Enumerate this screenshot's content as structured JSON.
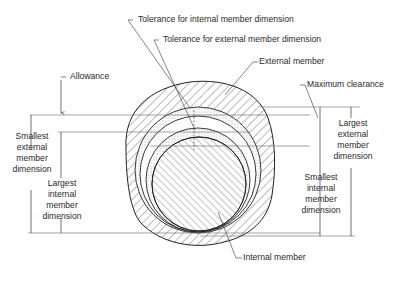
{
  "diagram": {
    "type": "tolerance-fit-cross-section",
    "callouts": {
      "tol_internal": "Tolerance for internal member dimension",
      "tol_external": "Tolerance for external member dimension",
      "allowance": "Allowance",
      "external_member": "External member",
      "max_clearance": "Maximum clearance",
      "internal_member": "Internal member"
    },
    "left_dims": {
      "smallest_external": [
        "Smallest",
        "external",
        "member",
        "dimension"
      ],
      "largest_internal": [
        "Largest",
        "internal",
        "member",
        "dimension"
      ]
    },
    "right_dims": {
      "largest_external": [
        "Largest",
        "external",
        "member",
        "dimension"
      ],
      "smallest_internal": [
        "Smallest",
        "internal",
        "member",
        "dimension"
      ]
    },
    "colors": {
      "line": "#222222",
      "hatch": "#555555",
      "stipple": "#444444",
      "background": "#ffffff"
    }
  }
}
